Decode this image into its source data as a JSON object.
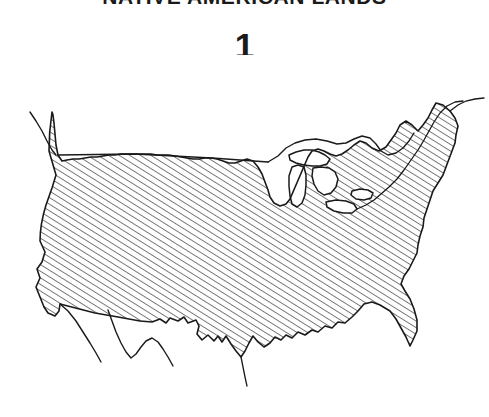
{
  "figure": {
    "title": "NATIVE AMERICAN LANDS",
    "number_label": "1",
    "style": "hand-drawn pen and ink line map with diagonal hatch fill",
    "background_color": "#ffffff",
    "ink_color": "#1a1a1a"
  },
  "map": {
    "name": "contiguous-united-states",
    "projection_note": "conventional lower-48 outline",
    "fill": {
      "type": "diagonal-hatch",
      "angle_degrees": 60,
      "spacing_px": 5.5,
      "stroke_color": "#1a1a1a",
      "stroke_width_px": 1.1
    },
    "outline": {
      "stroke_color": "#1a1a1a",
      "stroke_width_px": 1.6
    },
    "hatched_regions": [
      "contiguous United States"
    ],
    "unhatched_features": [
      "Lake Superior",
      "Lake Michigan",
      "Lake Huron",
      "Lake Erie",
      "Lake Ontario",
      "Canada (north of border)",
      "Baja California peninsula"
    ],
    "border_features": [
      "49th parallel northern border",
      "Great Lakes water boundary",
      "Atlantic coastline",
      "Gulf of Mexico coastline",
      "Pacific coastline",
      "southwestern border with Mexico"
    ]
  }
}
